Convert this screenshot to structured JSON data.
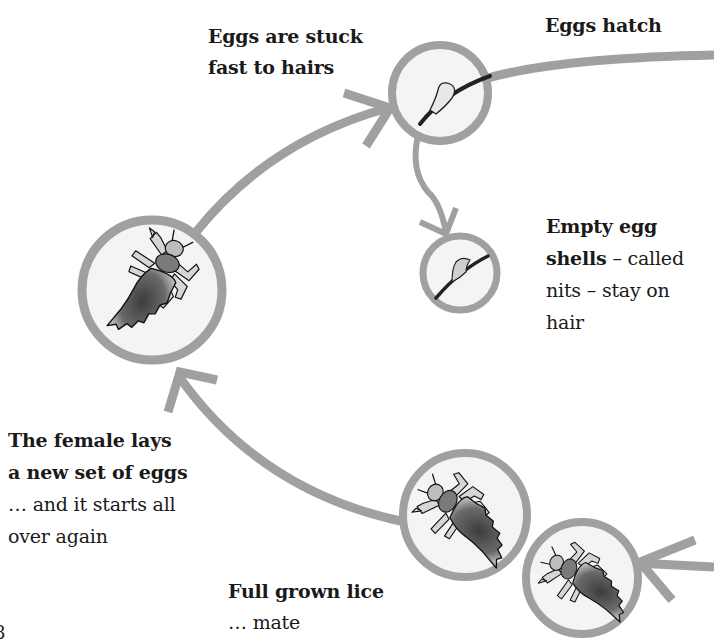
{
  "diagram": {
    "colors": {
      "arrow": "#a0a0a0",
      "circle_fill": "#f4f4f4",
      "text": "#1a1a1a",
      "louse_dark": "#4a4a4a",
      "louse_light": "#c8c8c8"
    },
    "stages": [
      {
        "id": "eggs-stuck",
        "icon": "egg-on-hair-icon",
        "label_lines": [
          "Eggs are stuck",
          "fast to hairs"
        ]
      },
      {
        "id": "eggs-hatch",
        "label_lines": [
          "Eggs hatch"
        ]
      },
      {
        "id": "empty-shells",
        "icon": "empty-egg-shell-icon",
        "label_bold": "Empty egg shells",
        "label_rest": " – called nits – stay on hair",
        "label_lines": [
          "Empty egg",
          "shells – called",
          "nits – stay on",
          "hair"
        ]
      },
      {
        "id": "full-grown",
        "icon": "mating-lice-icon",
        "label_bold": "Full grown lice",
        "label_rest": "… mate"
      },
      {
        "id": "female-lays",
        "icon": "adult-louse-icon",
        "label_bold_lines": [
          "The female lays",
          "a new set of eggs"
        ],
        "label_rest_lines": [
          "… and it starts all",
          "over again"
        ]
      }
    ]
  },
  "labels": {
    "eggs_stuck_1": "Eggs are stuck",
    "eggs_stuck_2": "fast to hairs",
    "eggs_hatch": "Eggs hatch",
    "empty_1": "Empty egg",
    "empty_2_bold": "shells",
    "empty_2_rest": " – called",
    "empty_3": "nits – stay on",
    "empty_4": "hair",
    "female_1": "The female lays",
    "female_2": "a new set of eggs",
    "female_3": "… and it starts all",
    "female_4": "over again",
    "grown_1": "Full grown lice",
    "grown_2": "… mate"
  },
  "page_number": "8"
}
